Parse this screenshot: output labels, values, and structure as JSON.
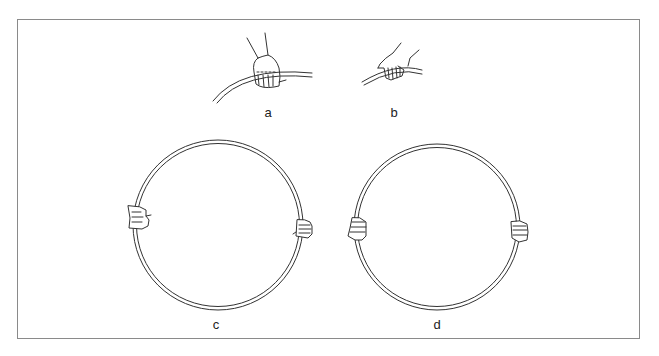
{
  "figure": {
    "type": "illustration",
    "border_color": "#8a8a8a",
    "stroke_color": "#333333",
    "panels": [
      {
        "id": "a",
        "label": "a",
        "description": "overhand grip on hoop, top view (fist over hoop)"
      },
      {
        "id": "b",
        "label": "b",
        "description": "grip with hand wrapped under hoop"
      },
      {
        "id": "c",
        "label": "c",
        "description": "hoop held with both hands at opposite sides, symmetric grip"
      },
      {
        "id": "d",
        "label": "d",
        "description": "hoop held with both hands at opposite sides, alternate grip"
      }
    ]
  }
}
